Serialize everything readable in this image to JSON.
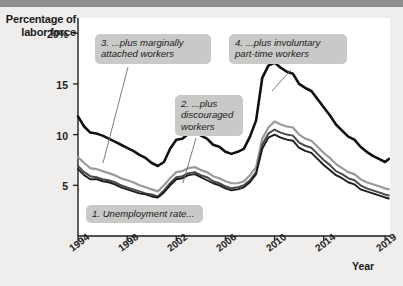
{
  "figure": {
    "background_color": "#efeeec",
    "plot_background_color": "#ffffff",
    "callout_color": "#c9c9c7",
    "axis_color": "#1d1d1d"
  },
  "axes": {
    "y_title_line1": "Percentage of",
    "y_title_line2": "labor force",
    "x_title": "Year",
    "y_ticks": [
      "20%",
      "15",
      "10",
      "5"
    ],
    "x_ticks": [
      "1994",
      "1998",
      "2002",
      "2006",
      "2010",
      "2014",
      "2019"
    ]
  },
  "callouts": [
    {
      "id": "callout-1",
      "text": "1. Unemployment rate..."
    },
    {
      "id": "callout-2",
      "text": "2. ...plus\ndiscouraged\nworkers"
    },
    {
      "id": "callout-3",
      "text": "3. ...plus marginally\nattached workers"
    },
    {
      "id": "callout-4",
      "text": "4. ...plus involuntary\npart-time workers"
    }
  ],
  "chart_data": {
    "type": "line",
    "title": "",
    "xlabel": "Year",
    "ylabel": "Percentage of labor force",
    "xlim": [
      1994,
      2019.4
    ],
    "ylim": [
      0,
      21.5
    ],
    "y_ticks": [
      5,
      10,
      15,
      20
    ],
    "x_ticks": [
      1994,
      1998,
      2002,
      2006,
      2010,
      2014,
      2019
    ],
    "grid": false,
    "legend": "none (inline callout labels)",
    "annotations": [
      "1. Unemployment rate...",
      "2. ...plus discouraged workers",
      "3. ...plus marginally attached workers",
      "4. ...plus involuntary part-time workers"
    ],
    "x": [
      1994.0,
      1994.5,
      1995.0,
      1995.5,
      1996.0,
      1996.5,
      1997.0,
      1997.5,
      1998.0,
      1998.5,
      1999.0,
      1999.5,
      2000.0,
      2000.5,
      2001.0,
      2001.5,
      2002.0,
      2002.5,
      2003.0,
      2003.5,
      2004.0,
      2004.5,
      2005.0,
      2005.5,
      2006.0,
      2006.5,
      2007.0,
      2007.5,
      2008.0,
      2008.5,
      2009.0,
      2009.5,
      2010.0,
      2010.5,
      2011.0,
      2011.5,
      2012.0,
      2012.5,
      2013.0,
      2013.5,
      2014.0,
      2014.5,
      2015.0,
      2015.5,
      2016.0,
      2016.5,
      2017.0,
      2017.5,
      2018.0,
      2018.5,
      2019.0,
      2019.3
    ],
    "series": [
      {
        "name": "4. ...plus involuntary part-time workers (U-6)",
        "color": "#111111",
        "width": 2.6,
        "values": [
          11.8,
          10.8,
          10.2,
          10.1,
          9.9,
          9.6,
          9.3,
          9.0,
          8.7,
          8.4,
          8.0,
          7.7,
          7.2,
          6.9,
          7.3,
          8.6,
          9.5,
          9.6,
          10.1,
          10.4,
          9.9,
          9.6,
          9.0,
          8.8,
          8.3,
          8.1,
          8.3,
          8.6,
          9.8,
          11.4,
          15.6,
          16.8,
          17.1,
          16.6,
          16.2,
          16.0,
          15.0,
          14.6,
          14.3,
          13.5,
          12.7,
          11.9,
          11.0,
          10.4,
          9.8,
          9.5,
          8.8,
          8.3,
          7.9,
          7.6,
          7.3,
          7.6
        ]
      },
      {
        "name": "3. ...plus marginally attached workers (U-5)",
        "color": "#9a9a9a",
        "width": 2.2,
        "values": [
          7.8,
          7.2,
          6.7,
          6.6,
          6.4,
          6.2,
          6.0,
          5.7,
          5.5,
          5.3,
          5.0,
          4.8,
          4.6,
          4.4,
          5.0,
          5.7,
          6.3,
          6.4,
          6.7,
          6.8,
          6.5,
          6.3,
          5.9,
          5.7,
          5.4,
          5.2,
          5.2,
          5.4,
          6.0,
          6.8,
          9.6,
          10.7,
          11.3,
          11.0,
          10.8,
          10.7,
          10.0,
          9.6,
          9.4,
          8.8,
          8.2,
          7.7,
          7.1,
          6.7,
          6.3,
          6.1,
          5.6,
          5.3,
          5.1,
          4.9,
          4.7,
          4.6
        ]
      },
      {
        "name": "2. ...plus discouraged workers (U-4)",
        "color": "#4a4a4a",
        "width": 2.0,
        "values": [
          6.9,
          6.3,
          5.9,
          5.8,
          5.6,
          5.5,
          5.3,
          5.0,
          4.8,
          4.6,
          4.4,
          4.2,
          4.1,
          3.9,
          4.5,
          5.2,
          5.8,
          5.9,
          6.2,
          6.3,
          6.0,
          5.8,
          5.4,
          5.2,
          4.9,
          4.7,
          4.8,
          5.0,
          5.5,
          6.3,
          9.0,
          10.1,
          10.5,
          10.2,
          10.0,
          9.9,
          9.2,
          8.9,
          8.7,
          8.1,
          7.5,
          7.0,
          6.4,
          6.1,
          5.7,
          5.5,
          5.0,
          4.7,
          4.5,
          4.3,
          4.1,
          4.0
        ]
      },
      {
        "name": "1. Unemployment rate (U-3)",
        "color": "#1d1d1d",
        "width": 1.9,
        "values": [
          6.6,
          6.0,
          5.6,
          5.6,
          5.4,
          5.3,
          5.1,
          4.8,
          4.6,
          4.4,
          4.2,
          4.1,
          3.9,
          3.8,
          4.3,
          5.0,
          5.6,
          5.7,
          6.0,
          6.1,
          5.8,
          5.5,
          5.2,
          5.0,
          4.7,
          4.5,
          4.6,
          4.8,
          5.3,
          6.1,
          8.6,
          9.7,
          10.0,
          9.7,
          9.5,
          9.4,
          8.7,
          8.4,
          8.2,
          7.6,
          7.0,
          6.5,
          6.0,
          5.7,
          5.3,
          5.1,
          4.6,
          4.4,
          4.2,
          4.0,
          3.8,
          3.7
        ]
      }
    ]
  },
  "callout_leaders": [
    {
      "from": "callout-3",
      "x1": 128,
      "y1": 60,
      "x2": 103,
      "y2": 156
    },
    {
      "from": "callout-2",
      "x1": 196,
      "y1": 131,
      "x2": 183,
      "y2": 176
    },
    {
      "from": "callout-4",
      "x1": 291,
      "y1": 63,
      "x2": 272,
      "y2": 84
    }
  ]
}
